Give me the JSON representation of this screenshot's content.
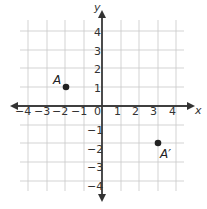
{
  "diagram": {
    "type": "coordinate-plane",
    "axes": {
      "x_label": "x",
      "y_label": "y",
      "x_ticks": [
        "−4",
        "−3",
        "−2",
        "−1",
        "0",
        "1",
        "2",
        "3",
        "4"
      ],
      "y_ticks_positive": [
        "4",
        "3",
        "2",
        "1"
      ],
      "y_ticks_negative": [
        "−1",
        "−2",
        "−3",
        "−4"
      ],
      "range": {
        "x": [
          -4,
          4
        ],
        "y": [
          -4,
          4
        ]
      }
    },
    "points": [
      {
        "label": "A",
        "x": -2,
        "y": 1
      },
      {
        "label": "A′",
        "x": 3,
        "y": -2
      }
    ],
    "colors": {
      "grid": "#c8c8c8",
      "axis": "#333333",
      "point": "#222222"
    }
  }
}
